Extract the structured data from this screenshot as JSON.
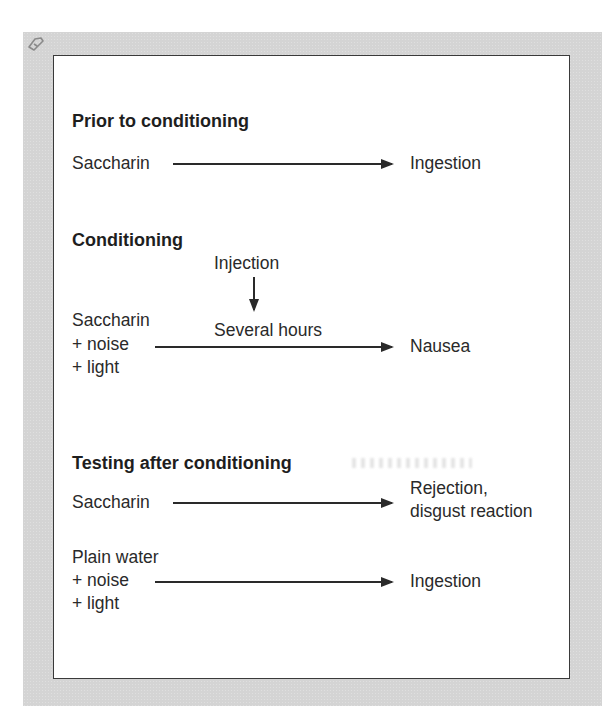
{
  "figure": {
    "corner_icon": "pencil-bookmark-icon",
    "colors": {
      "frame": "#d4d4d4",
      "panel": "#ffffff",
      "border": "#3a3a3a",
      "text": "#2a2a2a"
    },
    "sections": [
      {
        "heading": "Prior to conditioning",
        "rows": [
          {
            "stimulus": [
              "Saccharin"
            ],
            "response": [
              "Ingestion"
            ]
          }
        ]
      },
      {
        "heading": "Conditioning",
        "treatment": {
          "label": "Injection",
          "delay_label": "Several hours"
        },
        "rows": [
          {
            "stimulus": [
              "Saccharin",
              "+ noise",
              "+ light"
            ],
            "response": [
              "Nausea"
            ]
          }
        ]
      },
      {
        "heading": "Testing after conditioning",
        "rows": [
          {
            "stimulus": [
              "Saccharin"
            ],
            "response": [
              "Rejection,",
              "disgust reaction"
            ]
          },
          {
            "stimulus": [
              "Plain water",
              "+ noise",
              "+ light"
            ],
            "response": [
              "Ingestion"
            ]
          }
        ]
      }
    ]
  }
}
